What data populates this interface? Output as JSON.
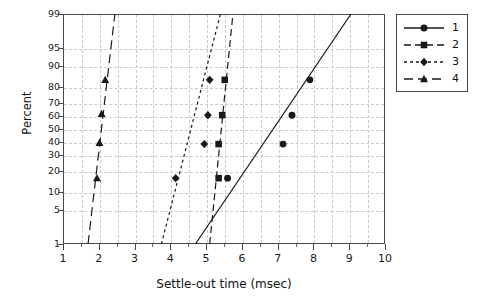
{
  "chart_data": {
    "type": "scatter",
    "title": "",
    "xlabel": "Settle-out time (msec)",
    "ylabel": "Percent",
    "xlim": [
      1,
      10
    ],
    "ylim": [
      1,
      99
    ],
    "yscale": "probability",
    "grid": true,
    "legend_position": "right-outside",
    "xticks": [
      1,
      2,
      3,
      4,
      5,
      6,
      7,
      8,
      9,
      10
    ],
    "xtick_labels": [
      "1",
      "2",
      "3",
      "4",
      "5",
      "6",
      "7",
      "8",
      "9",
      "10"
    ],
    "yticks": [
      1,
      5,
      10,
      20,
      30,
      40,
      50,
      60,
      70,
      80,
      90,
      95,
      99
    ],
    "ytick_labels": [
      "1",
      "5",
      "10",
      "20",
      "30",
      "40",
      "50",
      "60",
      "70",
      "80",
      "90",
      "95",
      "99"
    ],
    "series": [
      {
        "name": "1",
        "marker": "circle",
        "linestyle": "solid",
        "color": "#1a1a1a",
        "points": [
          {
            "x": 5.6,
            "y": 16
          },
          {
            "x": 7.15,
            "y": 38
          },
          {
            "x": 7.4,
            "y": 61
          },
          {
            "x": 7.9,
            "y": 84
          }
        ],
        "fit_line": {
          "x1": 4.7,
          "y1": 1,
          "x2": 9.05,
          "y2": 99
        }
      },
      {
        "name": "2",
        "marker": "square",
        "linestyle": "dashed",
        "color": "#1a1a1a",
        "points": [
          {
            "x": 5.35,
            "y": 16
          },
          {
            "x": 5.35,
            "y": 38
          },
          {
            "x": 5.45,
            "y": 61
          },
          {
            "x": 5.52,
            "y": 84
          }
        ],
        "fit_line": {
          "x1": 5.1,
          "y1": 1,
          "x2": 5.75,
          "y2": 99
        }
      },
      {
        "name": "3",
        "marker": "diamond",
        "linestyle": "dotted",
        "color": "#1a1a1a",
        "points": [
          {
            "x": 4.15,
            "y": 16
          },
          {
            "x": 4.95,
            "y": 38
          },
          {
            "x": 5.05,
            "y": 61
          },
          {
            "x": 5.1,
            "y": 84
          }
        ],
        "fit_line": {
          "x1": 3.75,
          "y1": 1,
          "x2": 5.4,
          "y2": 99
        }
      },
      {
        "name": "4",
        "marker": "triangle",
        "linestyle": "longdash",
        "color": "#1a1a1a",
        "points": [
          {
            "x": 1.95,
            "y": 16
          },
          {
            "x": 2.02,
            "y": 39
          },
          {
            "x": 2.08,
            "y": 62
          },
          {
            "x": 2.18,
            "y": 84
          }
        ],
        "fit_line": {
          "x1": 1.7,
          "y1": 1,
          "x2": 2.45,
          "y2": 99
        }
      }
    ]
  },
  "legend": {
    "entries": [
      {
        "label": "1"
      },
      {
        "label": "2"
      },
      {
        "label": "3"
      },
      {
        "label": "4"
      }
    ]
  },
  "colors": {
    "axis": "#4a4a4a",
    "grid": "#c9c9cf",
    "data": "#1a1a1a",
    "background": "#ffffff"
  }
}
